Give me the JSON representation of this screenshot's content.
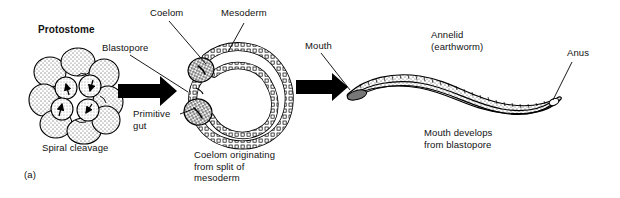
{
  "figure": {
    "panel_marker": "(a)",
    "heading": "Protostome",
    "stage1_caption": "Spiral cleavage",
    "stage2_caption": "Coelom originating\nfrom split of\nmesoderm",
    "stage3_caption": "Mouth develops\nfrom blastopore",
    "organism_label": "Annelid\n(earthworm)"
  },
  "labels": {
    "blastopore": "Blastopore",
    "coelom": "Coelom",
    "mesoderm": "Mesoderm",
    "primitive_gut": "Primitive\ngut",
    "mouth": "Mouth",
    "anus": "Anus"
  },
  "colors": {
    "ink": "#000000",
    "background": "#ffffff",
    "stipple": "#3a3a3a"
  },
  "icons": {
    "arrow1": "right-arrow-icon",
    "arrow2": "right-arrow-icon"
  }
}
